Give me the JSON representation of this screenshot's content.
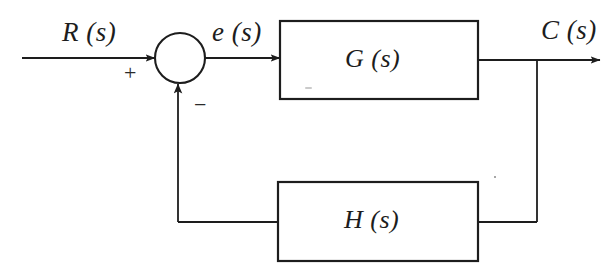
{
  "figure": {
    "kind": "block-diagram",
    "background_color": "#ffffff",
    "ink_color": "#1d1d1d"
  },
  "labels": {
    "input_signal": "R (s)",
    "error_signal": "e (s)",
    "output_signal": "C (s)",
    "forward_block": "G (s)",
    "feedback_block": "H (s)",
    "positive_sign": "+",
    "negative_sign": "−"
  },
  "blocks": [
    {
      "id": "forward-block",
      "label": "G (s)",
      "x": 280,
      "y": 21,
      "width": 198,
      "height": 78
    },
    {
      "id": "feedback-block",
      "label": "H (s)",
      "x": 278,
      "y": 182,
      "width": 200,
      "height": 79
    }
  ],
  "summing_junction": {
    "id": "summing-junction",
    "center_x": 180,
    "center_y": 58,
    "radius": 25,
    "inputs": [
      {
        "from": "input_signal",
        "sign": "+",
        "direction": "left"
      },
      {
        "from": "feedback_block",
        "sign": "−",
        "direction": "bottom"
      }
    ]
  },
  "connections": [
    {
      "id": "input-line",
      "from": "R(s)",
      "to": "summing-junction",
      "arrow": true
    },
    {
      "id": "error-line",
      "from": "summing-junction",
      "to": "forward-block",
      "arrow": true
    },
    {
      "id": "output-line",
      "from": "forward-block",
      "to": "C(s)",
      "arrow": true
    },
    {
      "id": "tap-line",
      "from": "output-line",
      "to": "feedback-block",
      "arrow": false
    },
    {
      "id": "feedback-line",
      "from": "feedback-block",
      "to": "summing-junction",
      "arrow": true
    }
  ],
  "geometry": {
    "main_line_y": 58,
    "input_line_start_x": 22,
    "output_arrow_tip_x": 600,
    "tap_x": 537,
    "feedback_return_x": 178,
    "feedback_line_y": 222
  }
}
